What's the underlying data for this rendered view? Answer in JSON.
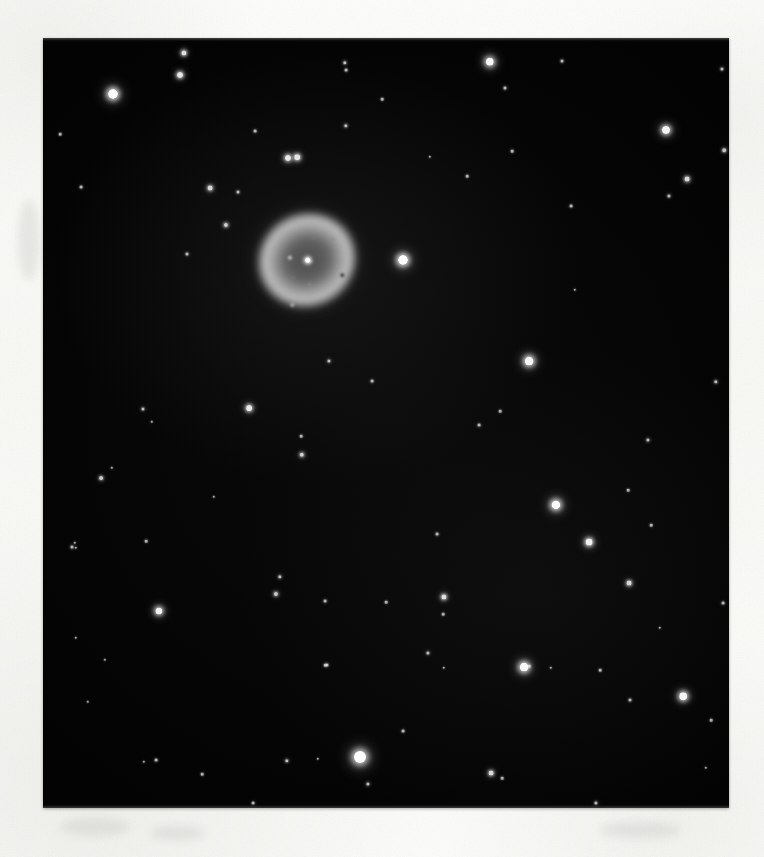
{
  "document": {
    "kind": "astronomical-photographic-print",
    "subject_title": "Ring Nebula M57",
    "paper_color": "#fbfbf9",
    "plate_color": "#030303",
    "caption": ""
  },
  "plate": {
    "x": 43,
    "y": 38,
    "width": 686,
    "height": 770,
    "border_style": "trimmed-print"
  },
  "nebula": {
    "name": "Ring Nebula M57",
    "center_x": 307,
    "center_y": 260,
    "halo_rx": 54,
    "halo_ry": 52,
    "ring_rx": 48,
    "ring_ry": 45,
    "inner_rx": 27,
    "inner_ry": 24,
    "rotation_deg": -28,
    "central_star": true,
    "ring_color": "#cdcdcd",
    "interior_color": "#4e4e4e",
    "specks": [
      {
        "x": -14,
        "y": -10,
        "r": 2.0,
        "c": "rgba(225,225,225,0.80)"
      },
      {
        "x": 2,
        "y": 3,
        "r": 1.4,
        "c": "rgba(210,210,210,0.55)"
      },
      {
        "x": -20,
        "y": 9,
        "r": 1.2,
        "c": "rgba(190,190,190,0.40)"
      },
      {
        "x": 16,
        "y": -16,
        "r": 1.2,
        "c": "rgba(185,185,185,0.38)"
      },
      {
        "x": 24,
        "y": 30,
        "r": 2.0,
        "c": "rgba(18,18,18,0.75)"
      },
      {
        "x": -34,
        "y": 33,
        "r": 2.2,
        "c": "rgba(235,235,235,0.55)"
      },
      {
        "x": 33,
        "y": -6,
        "r": 1.6,
        "c": "rgba(120,120,120,0.45)"
      },
      {
        "x": -9,
        "y": 22,
        "r": 1.3,
        "c": "rgba(170,170,170,0.35)"
      }
    ]
  },
  "chart_data": {
    "type": "scatter",
    "xlabel": "",
    "ylabel": "",
    "xlim": [
      43,
      729
    ],
    "ylim": [
      38,
      808
    ],
    "grid": false,
    "legend": "none",
    "note": "Star positions in page pixel coordinates; r = rendered core radius in px, b = relative brightness 0-1",
    "stars": [
      {
        "x": 113,
        "y": 94,
        "r": 5.0,
        "b": 0.96
      },
      {
        "x": 184,
        "y": 53,
        "r": 2.6,
        "b": 0.72
      },
      {
        "x": 180,
        "y": 75,
        "r": 3.0,
        "b": 0.78
      },
      {
        "x": 345,
        "y": 63,
        "r": 1.7,
        "b": 0.46
      },
      {
        "x": 346,
        "y": 126,
        "r": 1.7,
        "b": 0.44
      },
      {
        "x": 490,
        "y": 62,
        "r": 4.2,
        "b": 0.92
      },
      {
        "x": 505,
        "y": 88,
        "r": 1.5,
        "b": 0.4
      },
      {
        "x": 512,
        "y": 151,
        "r": 1.3,
        "b": 0.34
      },
      {
        "x": 562,
        "y": 61,
        "r": 1.5,
        "b": 0.38
      },
      {
        "x": 666,
        "y": 130,
        "r": 4.0,
        "b": 0.9
      },
      {
        "x": 687,
        "y": 179,
        "r": 2.4,
        "b": 0.66
      },
      {
        "x": 669,
        "y": 196,
        "r": 1.6,
        "b": 0.42
      },
      {
        "x": 346,
        "y": 70,
        "r": 1.4,
        "b": 0.36
      },
      {
        "x": 722,
        "y": 69,
        "r": 1.6,
        "b": 0.4
      },
      {
        "x": 724,
        "y": 150,
        "r": 1.8,
        "b": 0.46
      },
      {
        "x": 60,
        "y": 134,
        "r": 1.3,
        "b": 0.3
      },
      {
        "x": 210,
        "y": 188,
        "r": 2.4,
        "b": 0.64
      },
      {
        "x": 255,
        "y": 131,
        "r": 1.4,
        "b": 0.36
      },
      {
        "x": 288,
        "y": 158,
        "r": 3.0,
        "b": 0.8
      },
      {
        "x": 297,
        "y": 157,
        "r": 2.8,
        "b": 0.76
      },
      {
        "x": 238,
        "y": 192,
        "r": 1.5,
        "b": 0.4
      },
      {
        "x": 382,
        "y": 99,
        "r": 1.3,
        "b": 0.32
      },
      {
        "x": 226,
        "y": 225,
        "r": 2.1,
        "b": 0.58
      },
      {
        "x": 403,
        "y": 260,
        "r": 5.0,
        "b": 0.97
      },
      {
        "x": 81,
        "y": 187,
        "r": 1.4,
        "b": 0.34
      },
      {
        "x": 467,
        "y": 176,
        "r": 1.3,
        "b": 0.32
      },
      {
        "x": 187,
        "y": 254,
        "r": 1.5,
        "b": 0.38
      },
      {
        "x": 529,
        "y": 361,
        "r": 4.4,
        "b": 0.93
      },
      {
        "x": 571,
        "y": 206,
        "r": 1.4,
        "b": 0.34
      },
      {
        "x": 329,
        "y": 361,
        "r": 1.6,
        "b": 0.42
      },
      {
        "x": 143,
        "y": 409,
        "r": 1.6,
        "b": 0.42
      },
      {
        "x": 152,
        "y": 422,
        "r": 1.2,
        "b": 0.28
      },
      {
        "x": 249,
        "y": 408,
        "r": 2.9,
        "b": 0.8
      },
      {
        "x": 372,
        "y": 381,
        "r": 1.4,
        "b": 0.34
      },
      {
        "x": 716,
        "y": 382,
        "r": 1.7,
        "b": 0.44
      },
      {
        "x": 301,
        "y": 436,
        "r": 1.3,
        "b": 0.3
      },
      {
        "x": 101,
        "y": 478,
        "r": 1.9,
        "b": 0.52
      },
      {
        "x": 302,
        "y": 455,
        "r": 2.2,
        "b": 0.6
      },
      {
        "x": 479,
        "y": 425,
        "r": 1.4,
        "b": 0.34
      },
      {
        "x": 500,
        "y": 411,
        "r": 1.3,
        "b": 0.3
      },
      {
        "x": 556,
        "y": 505,
        "r": 4.6,
        "b": 0.95
      },
      {
        "x": 589,
        "y": 542,
        "r": 3.4,
        "b": 0.85
      },
      {
        "x": 648,
        "y": 440,
        "r": 1.6,
        "b": 0.42
      },
      {
        "x": 628,
        "y": 490,
        "r": 1.3,
        "b": 0.3
      },
      {
        "x": 112,
        "y": 468,
        "r": 1.2,
        "b": 0.28
      },
      {
        "x": 72,
        "y": 547,
        "r": 1.5,
        "b": 0.4
      },
      {
        "x": 76,
        "y": 548,
        "r": 1.2,
        "b": 0.26
      },
      {
        "x": 146,
        "y": 541,
        "r": 1.3,
        "b": 0.3
      },
      {
        "x": 75,
        "y": 543,
        "r": 1.2,
        "b": 0.26
      },
      {
        "x": 437,
        "y": 534,
        "r": 1.4,
        "b": 0.34
      },
      {
        "x": 651,
        "y": 525,
        "r": 1.3,
        "b": 0.3
      },
      {
        "x": 159,
        "y": 611,
        "r": 3.6,
        "b": 0.88
      },
      {
        "x": 76,
        "y": 638,
        "r": 1.2,
        "b": 0.26
      },
      {
        "x": 280,
        "y": 577,
        "r": 1.7,
        "b": 0.46
      },
      {
        "x": 276,
        "y": 594,
        "r": 2.1,
        "b": 0.56
      },
      {
        "x": 325,
        "y": 601,
        "r": 1.4,
        "b": 0.34
      },
      {
        "x": 444,
        "y": 597,
        "r": 2.6,
        "b": 0.72
      },
      {
        "x": 629,
        "y": 583,
        "r": 2.4,
        "b": 0.66
      },
      {
        "x": 428,
        "y": 653,
        "r": 1.6,
        "b": 0.42
      },
      {
        "x": 386,
        "y": 602,
        "r": 1.3,
        "b": 0.3
      },
      {
        "x": 443,
        "y": 614,
        "r": 1.3,
        "b": 0.28
      },
      {
        "x": 529,
        "y": 666,
        "r": 1.3,
        "b": 0.3
      },
      {
        "x": 444,
        "y": 668,
        "r": 1.2,
        "b": 0.26
      },
      {
        "x": 723,
        "y": 603,
        "r": 1.4,
        "b": 0.34
      },
      {
        "x": 761,
        "y": 697,
        "r": 1.2,
        "b": 0.26
      },
      {
        "x": 327,
        "y": 665,
        "r": 1.5,
        "b": 0.38
      },
      {
        "x": 524,
        "y": 667,
        "r": 4.4,
        "b": 0.93
      },
      {
        "x": 600,
        "y": 670,
        "r": 1.3,
        "b": 0.3
      },
      {
        "x": 683,
        "y": 696,
        "r": 3.8,
        "b": 0.9
      },
      {
        "x": 325,
        "y": 665,
        "r": 1.3,
        "b": 0.3
      },
      {
        "x": 403,
        "y": 731,
        "r": 1.4,
        "b": 0.34
      },
      {
        "x": 551,
        "y": 668,
        "r": 1.2,
        "b": 0.26
      },
      {
        "x": 156,
        "y": 760,
        "r": 1.4,
        "b": 0.34
      },
      {
        "x": 202,
        "y": 774,
        "r": 1.3,
        "b": 0.3
      },
      {
        "x": 287,
        "y": 761,
        "r": 1.7,
        "b": 0.46
      },
      {
        "x": 144,
        "y": 762,
        "r": 1.2,
        "b": 0.26
      },
      {
        "x": 318,
        "y": 759,
        "r": 1.2,
        "b": 0.26
      },
      {
        "x": 360,
        "y": 757,
        "r": 6.0,
        "b": 1.0
      },
      {
        "x": 368,
        "y": 784,
        "r": 1.6,
        "b": 0.42
      },
      {
        "x": 491,
        "y": 773,
        "r": 2.4,
        "b": 0.66
      },
      {
        "x": 502,
        "y": 778,
        "r": 1.3,
        "b": 0.3
      },
      {
        "x": 630,
        "y": 700,
        "r": 1.5,
        "b": 0.36
      },
      {
        "x": 711,
        "y": 720,
        "r": 1.3,
        "b": 0.28
      },
      {
        "x": 253,
        "y": 803,
        "r": 1.4,
        "b": 0.32
      },
      {
        "x": 596,
        "y": 803,
        "r": 1.6,
        "b": 0.4
      },
      {
        "x": 706,
        "y": 768,
        "r": 1.2,
        "b": 0.26
      },
      {
        "x": 88,
        "y": 702,
        "r": 1.2,
        "b": 0.26
      },
      {
        "x": 105,
        "y": 660,
        "r": 1.2,
        "b": 0.26
      },
      {
        "x": 660,
        "y": 628,
        "r": 1.2,
        "b": 0.26
      },
      {
        "x": 214,
        "y": 497,
        "r": 1.2,
        "b": 0.26
      },
      {
        "x": 575,
        "y": 290,
        "r": 1.2,
        "b": 0.26
      },
      {
        "x": 430,
        "y": 157,
        "r": 1.2,
        "b": 0.26
      }
    ]
  },
  "margin_marks": [
    {
      "x": 60,
      "y": 818,
      "w": 70,
      "h": 18
    },
    {
      "x": 150,
      "y": 826,
      "w": 55,
      "h": 14
    },
    {
      "x": 600,
      "y": 822,
      "w": 80,
      "h": 16
    },
    {
      "x": 18,
      "y": 200,
      "w": 22,
      "h": 80
    }
  ]
}
